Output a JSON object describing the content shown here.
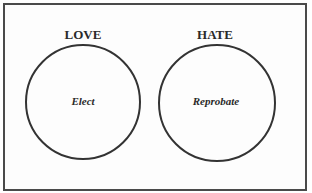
{
  "diagram": {
    "type": "two-circle concept diagram",
    "groups": [
      {
        "heading": "LOVE",
        "label": "Elect",
        "cx": 83,
        "cy": 101,
        "r": 57
      },
      {
        "heading": "HATE",
        "label": "Reprobate",
        "cx": 217,
        "cy": 101,
        "r": 58
      }
    ],
    "colors": {
      "stroke": "#333333",
      "border": "#4a4a4a",
      "text": "#2a2a2a",
      "background": "#fdfdfd"
    }
  }
}
